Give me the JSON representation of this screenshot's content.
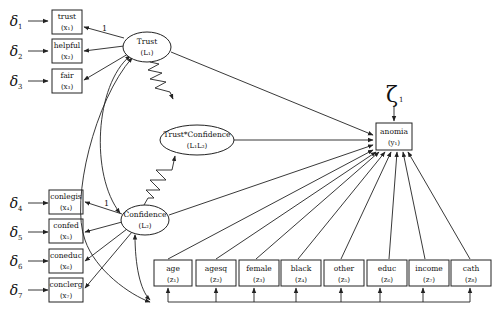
{
  "diagram": {
    "type": "structural-equation-model",
    "latent": [
      {
        "id": "L1",
        "label": "Trust",
        "sub": "(L₁)"
      },
      {
        "id": "L2",
        "label": "Confidence",
        "sub": "(L₂)"
      },
      {
        "id": "L1L2",
        "label": "Trust*Confidence",
        "sub": "(L₁L₂)"
      }
    ],
    "indicators": [
      {
        "label": "trust",
        "sub": "(x₁)",
        "error": "δ",
        "error_sub": "1",
        "loading": "1"
      },
      {
        "label": "helpful",
        "sub": "(x₂)",
        "error": "δ",
        "error_sub": "2"
      },
      {
        "label": "fair",
        "sub": "(x₃)",
        "error": "δ",
        "error_sub": "3"
      },
      {
        "label": "conlegis",
        "sub": "(x₄)",
        "error": "δ",
        "error_sub": "4",
        "loading": "1"
      },
      {
        "label": "confed",
        "sub": "(x₅)",
        "error": "δ",
        "error_sub": "5"
      },
      {
        "label": "coneduc",
        "sub": "(x₆)",
        "error": "δ",
        "error_sub": "6"
      },
      {
        "label": "conclerg",
        "sub": "(x₇)",
        "error": "δ",
        "error_sub": "7"
      }
    ],
    "outcome": {
      "label": "anomia",
      "sub": "(y₁)",
      "disturbance": "ζ",
      "disturbance_sub": "1"
    },
    "covariates": [
      {
        "label": "age",
        "sub": "(z₁)"
      },
      {
        "label": "agesq",
        "sub": "(z₂)"
      },
      {
        "label": "female",
        "sub": "(z₃)"
      },
      {
        "label": "black",
        "sub": "(z₄)"
      },
      {
        "label": "other",
        "sub": "(z₅)"
      },
      {
        "label": "educ",
        "sub": "(z₆)"
      },
      {
        "label": "income",
        "sub": "(z₇)"
      },
      {
        "label": "cath",
        "sub": "(z₈)"
      }
    ],
    "loading_label": "1"
  }
}
